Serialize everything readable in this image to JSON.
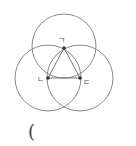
{
  "diagram": {
    "labels": {
      "top_vertex": "ㄱ",
      "left_vertex": "ㄴ",
      "right_vertex": "ㄷ"
    },
    "bottom_text": "(",
    "colors": {
      "stroke": "#888888",
      "point": "#333333",
      "text": "#444444"
    }
  }
}
